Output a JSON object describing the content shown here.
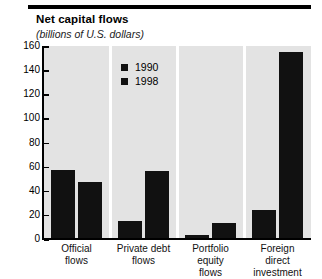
{
  "chart_data": {
    "type": "bar",
    "title": "Net capital flows",
    "subtitle": "(billions of U.S. dollars)",
    "xlabel": "",
    "ylabel": "",
    "ylim": [
      0,
      160
    ],
    "yticks": [
      0,
      20,
      40,
      60,
      80,
      100,
      120,
      140,
      160
    ],
    "ytick_labels": [
      "0",
      "20",
      "40",
      "60",
      "80",
      "100",
      "120",
      "140",
      "160"
    ],
    "grid": false,
    "legend_position": "upper-left-inside",
    "categories": [
      "Official\nflows",
      "Private debt\nflows",
      "Portfolio\nequity\nflows",
      "Foreign\ndirect\ninvestment"
    ],
    "series": [
      {
        "name": "1990",
        "color": "#111111",
        "values": [
          57,
          15,
          3,
          24
        ]
      },
      {
        "name": "1998",
        "color": "#111111",
        "values": [
          47,
          56,
          13,
          155
        ]
      }
    ]
  },
  "colors": {
    "bar": "#111111",
    "plot_background": "#e3e3e3",
    "page_background": "#ffffff",
    "axis": "#000000",
    "separator": "#ffffff"
  },
  "icons": {
    "legend_swatch_1990": "filled-square-icon",
    "legend_swatch_1998": "filled-square-icon"
  }
}
